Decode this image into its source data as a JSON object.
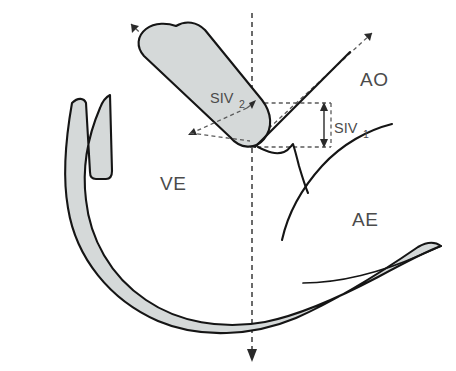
{
  "figure": {
    "type": "anatomical-diagram",
    "background_color": "#ffffff",
    "tissue_fill_color": "#d5d9d9",
    "outline_color": "#151515",
    "dashed_guide_color": "#5a5a5a",
    "label_text_color": "#4b4b4b"
  },
  "labels": {
    "ao": "AO",
    "ve": "VE",
    "ae": "AE"
  },
  "measurements": [
    {
      "id": "siv2",
      "base": "SIV",
      "subscript": "2",
      "display": "SIV2",
      "orientation": "oblique",
      "target": "septum-band-thickness"
    },
    {
      "id": "siv1",
      "base": "SIV",
      "subscript": "1",
      "display": "SIV1",
      "orientation": "vertical",
      "target": "aortic-root-offset-height"
    }
  ],
  "structures": [
    {
      "id": "septum-band",
      "name": "interventricular-septum-band",
      "filled": true
    },
    {
      "id": "ventricular-wall",
      "name": "ventricular-wall-crescent",
      "filled": true
    },
    {
      "id": "aortic-wall",
      "name": "aortic-root-wall",
      "filled": false
    },
    {
      "id": "aortic-valve-cusp",
      "name": "aortic-valve-cusp",
      "filled": false
    },
    {
      "id": "atrial-wall",
      "name": "atrial-wall-curve",
      "filled": false
    },
    {
      "id": "mitral-leaflet",
      "name": "mitral-leaflet",
      "filled": false
    }
  ],
  "guides": [
    {
      "id": "vertical-axis",
      "name": "vertical-reference-axis",
      "style": "dashed",
      "arrow_end": "bottom"
    },
    {
      "id": "septum-axis",
      "name": "septum-long-axis",
      "style": "dashed",
      "arrow_end": "top-left"
    },
    {
      "id": "aortic-axis",
      "name": "aortic-long-axis",
      "style": "dashed",
      "arrow_end": "top-right"
    },
    {
      "id": "siv1-box",
      "name": "siv1-dimension-box",
      "style": "dashed"
    }
  ]
}
